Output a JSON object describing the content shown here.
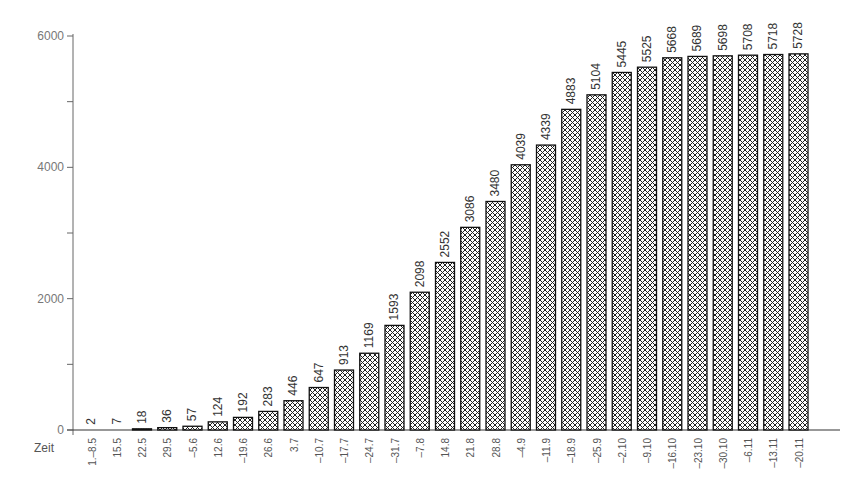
{
  "chart_data": {
    "type": "bar",
    "title": "",
    "xlabel": "Zeit",
    "ylabel": "",
    "ylim": [
      0,
      6000
    ],
    "yticks": [
      0,
      2000,
      4000,
      6000
    ],
    "yminor_ticks": [
      1000,
      3000,
      5000
    ],
    "grid": false,
    "legend": null,
    "pattern": "crosshatch",
    "categories": [
      "1.–8.5",
      "15.5",
      "22.5",
      "29.5",
      "–5.6",
      "12.6",
      "–19.6",
      "26.6",
      "3.7",
      "–10.7",
      "–17.7",
      "–24.7",
      "–31.7",
      "–7.8",
      "14.8",
      "21.8",
      "28.8",
      "–4.9",
      "–11.9",
      "–18.9",
      "–25.9",
      "–2.10",
      "–9.10",
      "–16.10",
      "–23.10",
      "–30.10",
      "–6.11",
      "–13.11",
      "–20.11"
    ],
    "values": [
      2,
      7,
      18,
      36,
      57,
      124,
      192,
      283,
      446,
      647,
      913,
      1169,
      1593,
      2098,
      2552,
      3086,
      3480,
      4039,
      4339,
      4883,
      5104,
      5445,
      5525,
      5668,
      5689,
      5698,
      5708,
      5718,
      5728
    ]
  }
}
